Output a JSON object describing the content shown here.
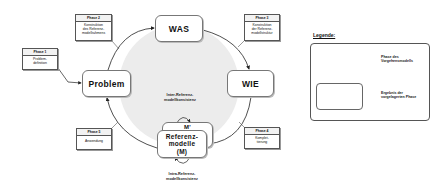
{
  "diagram": {
    "nodes": {
      "problem": "Problem",
      "was": "WAS",
      "wie": "WIE",
      "referenzmodelle_back": "M'",
      "referenzmodelle_line1": "Referenz-",
      "referenzmodelle_line2": "modelle",
      "referenzmodelle_line3": "(M)"
    },
    "phases": [
      {
        "head": "Phase 1",
        "body_line1": "Problem-",
        "body_line2": "definition",
        "body_line3": ""
      },
      {
        "head": "Phase 2",
        "body_line1": "Konstruktion",
        "body_line2": "des Referenz-",
        "body_line3": "modellrahmens"
      },
      {
        "head": "Phase 3",
        "body_line1": "Konstruktion",
        "body_line2": "der Referenz-",
        "body_line3": "modellstruktur"
      },
      {
        "head": "Phase 4",
        "body_line1": "Komplet-",
        "body_line2": "tierung",
        "body_line3": ""
      },
      {
        "head": "Phase 5",
        "body_line1": "Anwendung",
        "body_line2": "",
        "body_line3": ""
      }
    ],
    "labels": {
      "inter_line1": "Inter-Referenz-",
      "inter_line2": "modellkonsistenz",
      "intra_line1": "Intra-Referenz-",
      "intra_line2": "modellkonsistenz"
    },
    "colors": {
      "circle_fill": "#ececec",
      "arrow": "#222222",
      "border": "#777777"
    }
  },
  "legend": {
    "title": "Legende:",
    "arrow_line1": "Phase des",
    "arrow_line2": "Vorgehensmodells",
    "box_line1": "Ergebnis der",
    "box_line2": "vorgelagerten Phase"
  }
}
